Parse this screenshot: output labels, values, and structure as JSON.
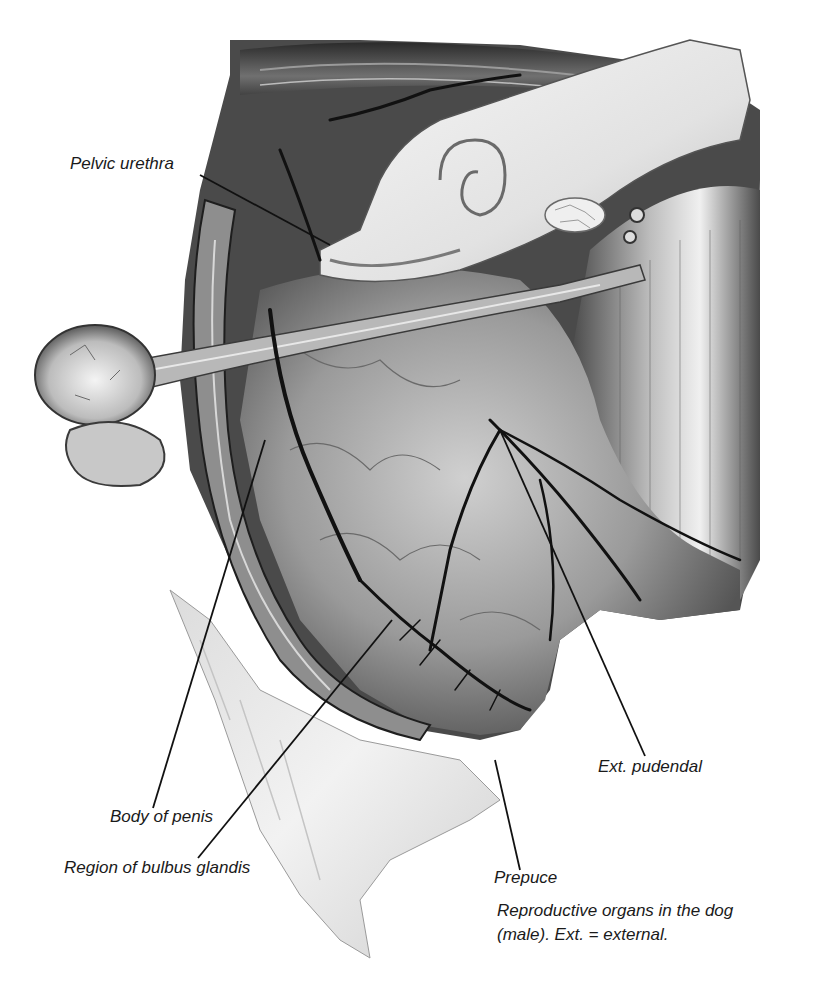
{
  "figure": {
    "title": "Reproductive organs in the dog (male)",
    "labels": [
      {
        "id": "pelvic-urethra",
        "text": "Pelvic urethra"
      },
      {
        "id": "body-of-penis",
        "text": "Body of penis"
      },
      {
        "id": "region-of-bulbus-glandis",
        "text": "Region of bulbus glandis"
      },
      {
        "id": "prepuce",
        "text": "Prepuce"
      },
      {
        "id": "ext-pudendal",
        "text": "Ext. pudendal"
      }
    ],
    "caption": {
      "line1": "Reproductive organs in the dog",
      "line2": "(male). Ext. = external."
    }
  },
  "colors": {
    "ink": "#1a1a1a",
    "dark_tissue": "#2b2b2b",
    "mid_tissue": "#8a8a8a",
    "light_tissue": "#d6d6d6",
    "bone": "#ececec",
    "background": "#ffffff"
  }
}
